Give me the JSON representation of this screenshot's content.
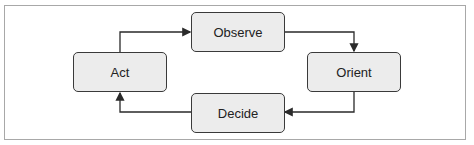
{
  "diagram": {
    "nodes": [
      {
        "id": "observe",
        "label": "Observe"
      },
      {
        "id": "orient",
        "label": "Orient"
      },
      {
        "id": "decide",
        "label": "Decide"
      },
      {
        "id": "act",
        "label": "Act"
      }
    ],
    "edges": [
      {
        "from": "act",
        "to": "observe"
      },
      {
        "from": "observe",
        "to": "orient"
      },
      {
        "from": "orient",
        "to": "decide"
      },
      {
        "from": "decide",
        "to": "act"
      }
    ],
    "colors": {
      "node_fill": "#ececec",
      "node_border": "#3a3a3a",
      "arrow": "#2a2a2a",
      "frame": "#a8a8a8"
    }
  }
}
